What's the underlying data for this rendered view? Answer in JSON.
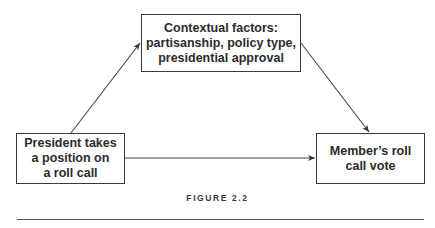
{
  "diagram": {
    "nodes": [
      {
        "id": "context",
        "label": "Contextual factors:\npartisanship, policy type,\npresidential approval"
      },
      {
        "id": "president",
        "label": "President takes\na position on\na roll call"
      },
      {
        "id": "vote",
        "label": "Member’s roll\ncall vote"
      }
    ],
    "edges": [
      {
        "from": "president",
        "to": "context"
      },
      {
        "from": "context",
        "to": "vote"
      },
      {
        "from": "president",
        "to": "vote"
      }
    ]
  },
  "caption": "FIGURE 2.2"
}
